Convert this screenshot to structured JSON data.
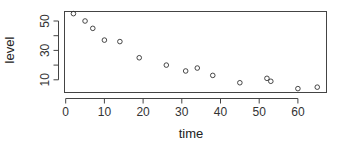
{
  "chart_data": {
    "type": "scatter",
    "title": "",
    "xlabel": "time",
    "ylabel": "level",
    "xlim": [
      0,
      67
    ],
    "ylim": [
      2,
      57
    ],
    "x_ticks": [
      0,
      10,
      20,
      30,
      40,
      50,
      60
    ],
    "y_ticks": [
      10,
      20,
      30,
      40,
      50
    ],
    "y_tick_labels": [
      "10",
      "",
      "30",
      "",
      "50"
    ],
    "grid": false,
    "legend": null,
    "marker": "open-circle",
    "points": [
      {
        "x": 2,
        "y": 55
      },
      {
        "x": 5,
        "y": 50
      },
      {
        "x": 7,
        "y": 45
      },
      {
        "x": 10,
        "y": 37
      },
      {
        "x": 14,
        "y": 36
      },
      {
        "x": 19,
        "y": 25
      },
      {
        "x": 26,
        "y": 20
      },
      {
        "x": 31,
        "y": 16
      },
      {
        "x": 34,
        "y": 18
      },
      {
        "x": 38,
        "y": 13
      },
      {
        "x": 45,
        "y": 8
      },
      {
        "x": 52,
        "y": 11
      },
      {
        "x": 53,
        "y": 9
      },
      {
        "x": 60,
        "y": 4
      },
      {
        "x": 65,
        "y": 5
      }
    ]
  },
  "colors": {
    "axis": "#444444",
    "marker": "#333333",
    "background": "#ffffff"
  }
}
